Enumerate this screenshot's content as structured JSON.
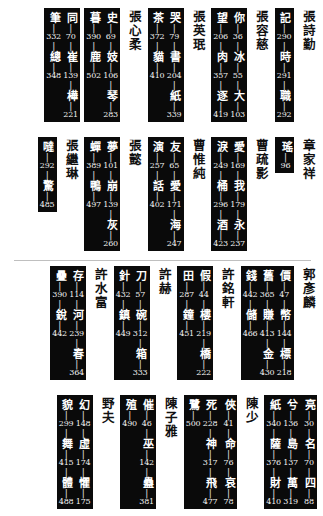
{
  "page": {
    "background": "#ffffff",
    "box_color": "#0a0a0a",
    "text_color_on_box": "#ffffff",
    "name_color": "#111111",
    "divider_color": "#bfbfbf",
    "reading_direction": "right-to-left vertical Chinese index",
    "divider_after_row": 2
  },
  "rows": [
    {
      "groups": [
        {
          "name": "張詩勤",
          "boxes": [
            {
              "columns": [
                {
                  "items": [
                    {
                      "ch": "記",
                      "num": "290"
                    },
                    {
                      "ch": "時",
                      "num": "291"
                    },
                    {
                      "ch": "職",
                      "num": "292"
                    }
                  ]
                }
              ]
            }
          ]
        },
        {
          "name": "張容慈",
          "boxes": [
            {
              "columns": [
                {
                  "items": [
                    {
                      "ch": "你",
                      "num": "36"
                    },
                    {
                      "ch": "冰",
                      "num": "55"
                    },
                    {
                      "ch": "大",
                      "num": "103"
                    }
                  ]
                },
                {
                  "items": [
                    {
                      "ch": "望",
                      "num": "206"
                    },
                    {
                      "ch": "肉",
                      "num": "357"
                    },
                    {
                      "ch": "逐",
                      "num": "419"
                    }
                  ]
                }
              ]
            }
          ]
        },
        {
          "name": "張英珉",
          "boxes": [
            {
              "columns": [
                {
                  "items": [
                    {
                      "ch": "哭",
                      "num": "79"
                    },
                    {
                      "ch": "書",
                      "num": "204"
                    },
                    {
                      "ch": "紙",
                      "num": "339"
                    }
                  ]
                },
                {
                  "items": [
                    {
                      "ch": "茶",
                      "num": "372"
                    },
                    {
                      "ch": "貓",
                      "num": "410"
                    }
                  ]
                }
              ]
            }
          ]
        },
        {
          "name": "張心柔",
          "boxes": [
            {
              "columns": [
                {
                  "items": [
                    {
                      "ch": "史",
                      "num": "69"
                    },
                    {
                      "ch": "妓",
                      "num": "106"
                    },
                    {
                      "ch": "琴",
                      "num": "283"
                    }
                  ]
                },
                {
                  "items": [
                    {
                      "ch": "暮",
                      "num": "390"
                    },
                    {
                      "ch": "鹿",
                      "num": "502"
                    }
                  ]
                }
              ]
            }
          ]
        },
        {
          "name": "",
          "boxes": [
            {
              "columns": [
                {
                  "items": [
                    {
                      "ch": "同",
                      "num": "70"
                    },
                    {
                      "ch": "崔",
                      "num": "139"
                    },
                    {
                      "ch": "樺",
                      "num": "221"
                    }
                  ]
                },
                {
                  "items": [
                    {
                      "ch": "筆",
                      "num": "332"
                    },
                    {
                      "ch": "總",
                      "num": "348"
                    }
                  ]
                }
              ]
            }
          ]
        }
      ]
    },
    {
      "groups": [
        {
          "name": "章家祥",
          "boxes": [
            {
              "columns": [
                {
                  "items": [
                    {
                      "ch": "瑤",
                      "num": "96"
                    }
                  ]
                }
              ]
            }
          ]
        },
        {
          "name": "曹疏影",
          "boxes": [
            {
              "columns": [
                {
                  "items": [
                    {
                      "ch": "愛",
                      "num": "169"
                    },
                    {
                      "ch": "我",
                      "num": "179"
                    },
                    {
                      "ch": "永",
                      "num": "237"
                    }
                  ]
                },
                {
                  "items": [
                    {
                      "ch": "淚",
                      "num": "249"
                    },
                    {
                      "ch": "桶",
                      "num": "296"
                    },
                    {
                      "ch": "酒",
                      "num": "423"
                    }
                  ]
                }
              ]
            }
          ]
        },
        {
          "name": "曹惟純",
          "boxes": [
            {
              "columns": [
                {
                  "items": [
                    {
                      "ch": "友",
                      "num": "65"
                    },
                    {
                      "ch": "愛",
                      "num": "171"
                    },
                    {
                      "ch": "海",
                      "num": "247"
                    }
                  ]
                },
                {
                  "items": [
                    {
                      "ch": "演",
                      "num": "257"
                    },
                    {
                      "ch": "話",
                      "num": "402"
                    }
                  ]
                }
              ]
            }
          ]
        },
        {
          "name": "張懿",
          "boxes": [
            {
              "columns": [
                {
                  "items": [
                    {
                      "ch": "夢",
                      "num": "101"
                    },
                    {
                      "ch": "崩",
                      "num": "139"
                    },
                    {
                      "ch": "灰",
                      "num": "260"
                    }
                  ]
                },
                {
                  "items": [
                    {
                      "ch": "蟬",
                      "num": "389"
                    },
                    {
                      "ch": "鴨",
                      "num": "497"
                    }
                  ]
                }
              ]
            }
          ]
        },
        {
          "name": "張繼琳",
          "boxes": [
            {
              "columns": [
                {
                  "items": [
                    {
                      "ch": "噠",
                      "num": "292"
                    },
                    {
                      "ch": "驚",
                      "num": "485"
                    }
                  ]
                }
              ]
            }
          ]
        }
      ]
    },
    {
      "groups": [
        {
          "name": "郭彥麟",
          "boxes": [
            {
              "columns": [
                {
                  "items": [
                    {
                      "ch": "價",
                      "num": "47"
                    },
                    {
                      "ch": "幣",
                      "num": "144"
                    },
                    {
                      "ch": "標",
                      "num": "218"
                    }
                  ]
                },
                {
                  "items": [
                    {
                      "ch": "舊",
                      "num": "365"
                    },
                    {
                      "ch": "賺",
                      "num": "413"
                    },
                    {
                      "ch": "金",
                      "num": "430"
                    }
                  ]
                },
                {
                  "items": [
                    {
                      "ch": "錢",
                      "num": "442"
                    },
                    {
                      "ch": "儲",
                      "num": "466"
                    }
                  ]
                }
              ]
            }
          ]
        },
        {
          "name": "許銘軒",
          "boxes": [
            {
              "columns": [
                {
                  "items": [
                    {
                      "ch": "假",
                      "num": "44"
                    },
                    {
                      "ch": "樓",
                      "num": "219"
                    },
                    {
                      "ch": "橋",
                      "num": "222"
                    }
                  ]
                },
                {
                  "items": [
                    {
                      "ch": "田",
                      "num": "287"
                    },
                    {
                      "ch": "鐘",
                      "num": "451"
                    }
                  ]
                }
              ]
            }
          ]
        },
        {
          "name": "許赫",
          "boxes": [
            {
              "columns": [
                {
                  "items": [
                    {
                      "ch": "刀",
                      "num": "57"
                    },
                    {
                      "ch": "碗",
                      "num": "312"
                    },
                    {
                      "ch": "箱",
                      "num": "333"
                    }
                  ]
                },
                {
                  "items": [
                    {
                      "ch": "針",
                      "num": "432"
                    },
                    {
                      "ch": "鎮",
                      "num": "449"
                    }
                  ]
                }
              ]
            }
          ]
        },
        {
          "name": "許水富",
          "boxes": [
            {
              "columns": [
                {
                  "items": [
                    {
                      "ch": "存",
                      "num": "114"
                    },
                    {
                      "ch": "河",
                      "num": "239"
                    },
                    {
                      "ch": "春",
                      "num": "364"
                    }
                  ]
                },
                {
                  "items": [
                    {
                      "ch": "疊",
                      "num": "390"
                    },
                    {
                      "ch": "銳",
                      "num": "442"
                    }
                  ]
                }
              ]
            }
          ]
        }
      ]
    },
    {
      "groups": [
        {
          "name": "",
          "boxes": [
            {
              "columns": [
                {
                  "items": [
                    {
                      "ch": "亮",
                      "num": "30"
                    },
                    {
                      "ch": "名",
                      "num": "70"
                    },
                    {
                      "ch": "四",
                      "num": "88"
                    }
                  ]
                },
                {
                  "items": [
                    {
                      "ch": "兮",
                      "num": "136"
                    },
                    {
                      "ch": "島",
                      "num": "137"
                    },
                    {
                      "ch": "萬",
                      "num": "319"
                    }
                  ]
                },
                {
                  "items": [
                    {
                      "ch": "紙",
                      "num": "340"
                    },
                    {
                      "ch": "薩",
                      "num": "376"
                    },
                    {
                      "ch": "財",
                      "num": "410"
                    }
                  ]
                }
              ]
            }
          ]
        },
        {
          "name": "陳少",
          "boxes": [
            {
              "columns": [
                {
                  "items": [
                    {
                      "ch": "俠",
                      "num": "41"
                    },
                    {
                      "ch": "命",
                      "num": "76"
                    },
                    {
                      "ch": "哀",
                      "num": "78"
                    }
                  ]
                },
                {
                  "items": [
                    {
                      "ch": "死",
                      "num": "228"
                    },
                    {
                      "ch": "神",
                      "num": "317"
                    },
                    {
                      "ch": "飛",
                      "num": "477"
                    }
                  ]
                },
                {
                  "items": [
                    {
                      "ch": "鷺",
                      "num": "500"
                    }
                  ]
                }
              ]
            }
          ]
        },
        {
          "name": "陳子雅",
          "boxes": [
            {
              "columns": [
                {
                  "items": [
                    {
                      "ch": "催",
                      "num": "46"
                    },
                    {
                      "ch": "巫",
                      "num": "142"
                    },
                    {
                      "ch": "蠱",
                      "num": "381"
                    }
                  ]
                },
                {
                  "items": [
                    {
                      "ch": "殖",
                      "num": "490"
                    }
                  ]
                }
              ]
            }
          ]
        },
        {
          "name": "野夫",
          "boxes": [
            {
              "columns": [
                {
                  "items": [
                    {
                      "ch": "幻",
                      "num": "148"
                    },
                    {
                      "ch": "虛",
                      "num": "174"
                    },
                    {
                      "ch": "懼",
                      "num": "175"
                    }
                  ]
                },
                {
                  "items": [
                    {
                      "ch": "貌",
                      "num": "299"
                    },
                    {
                      "ch": "舞",
                      "num": "415"
                    },
                    {
                      "ch": "體",
                      "num": "488"
                    }
                  ]
                }
              ]
            }
          ]
        }
      ]
    }
  ]
}
